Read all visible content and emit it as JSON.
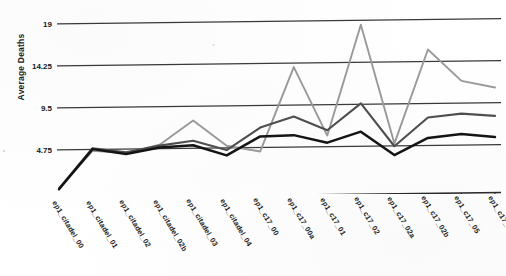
{
  "chart_data": {
    "type": "line",
    "title": "",
    "xlabel": "",
    "ylabel": "Average Deaths",
    "ylim": [
      0,
      19
    ],
    "yticks": [
      4.75,
      9.5,
      14.25,
      19
    ],
    "ytick_labels": [
      "4.75",
      "9.5",
      "14.25",
      "19"
    ],
    "grid": true,
    "legend": "none",
    "categories": [
      "ep1_citadel_00",
      "ep1_citadel_01",
      "ep1_citadel_02",
      "ep1_citadel_02b",
      "ep1_citadel_03",
      "ep1_citadel_04",
      "ep1_c17_00",
      "ep1_c17_00a",
      "ep1_c17_01",
      "ep1_c17_02",
      "ep1_c17_02a",
      "ep1_c17_02b",
      "ep1_c17_05",
      "ep1_c17_06"
    ],
    "series": [
      {
        "name": "series-light-gray",
        "color": "#9a9a9a",
        "values": [
          0.4,
          4.6,
          4.3,
          5.2,
          7.9,
          5.0,
          4.3,
          13.8,
          6.0,
          18.5,
          5.0,
          15.6,
          12.0,
          11.2
        ]
      },
      {
        "name": "series-mid-gray",
        "color": "#4f4f4f",
        "values": [
          0.4,
          4.9,
          4.4,
          5.1,
          5.6,
          4.5,
          7.0,
          8.2,
          6.6,
          9.6,
          4.7,
          7.9,
          8.3,
          8.0
        ]
      },
      {
        "name": "series-black",
        "color": "#141414",
        "values": [
          0.3,
          4.8,
          4.2,
          4.9,
          5.1,
          3.9,
          6.0,
          6.1,
          5.2,
          6.4,
          3.7,
          5.6,
          6.0,
          5.6
        ]
      }
    ]
  }
}
